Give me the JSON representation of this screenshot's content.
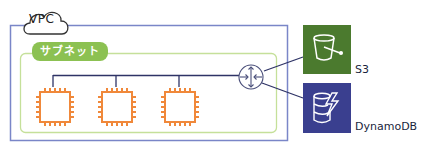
{
  "diagram": {
    "vpc": {
      "label": "VPC",
      "border_color": "#7a86c8"
    },
    "subnet": {
      "label": "サブネット",
      "color": "#8cc152",
      "border_color": "#c5e09a"
    },
    "instances": [
      {
        "name": "instance-1",
        "icon": "ec2-chip-icon",
        "color": "#f0883a"
      },
      {
        "name": "instance-2",
        "icon": "ec2-chip-icon",
        "color": "#f0883a"
      },
      {
        "name": "instance-3",
        "icon": "ec2-chip-icon",
        "color": "#f0883a"
      }
    ],
    "router": {
      "icon": "vpc-endpoint-router-icon",
      "color": "#4a4f7a"
    },
    "services": [
      {
        "label": "S3",
        "icon": "s3-bucket-icon",
        "color": "#4b7a2e"
      },
      {
        "label": "DynamoDB",
        "icon": "dynamodb-icon",
        "color": "#3a3f8f"
      }
    ],
    "connector_color": "#2e3366"
  }
}
